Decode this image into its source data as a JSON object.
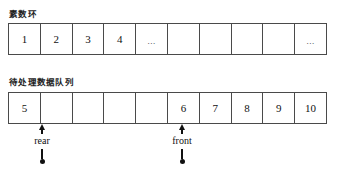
{
  "diagram": {
    "title_visible": false,
    "sections": [
      {
        "id": "prime-ring",
        "label": "素数环",
        "cells": [
          "1",
          "2",
          "3",
          "4",
          "...",
          "",
          "",
          "",
          "",
          "..."
        ]
      },
      {
        "id": "pending-queue",
        "label": "待处理数据队列",
        "cells": [
          "5",
          "",
          "",
          "",
          "",
          "6",
          "7",
          "8",
          "9",
          "10"
        ]
      }
    ],
    "pointers": [
      {
        "id": "rear",
        "label": "rear",
        "marker": "up-arrow",
        "target_cell_index": 1
      },
      {
        "id": "front",
        "label": "front",
        "marker": "up-arrow",
        "target_cell_index": 5
      }
    ],
    "colors": {
      "border": "#4a4a4a",
      "text": "#111111",
      "background": "#ffffff",
      "marker": "#111111"
    }
  }
}
